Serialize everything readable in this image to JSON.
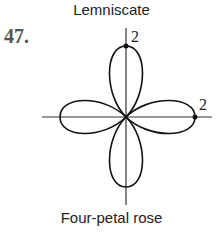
{
  "header": {
    "title": "Lemniscate"
  },
  "problem": {
    "number": "47."
  },
  "figure": {
    "caption": "Four-petal rose",
    "top_label": "2",
    "right_label": "2",
    "stroke_color": "#111111"
  }
}
